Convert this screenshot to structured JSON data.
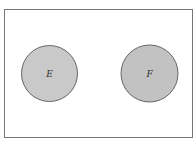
{
  "diagram": {
    "type": "venn",
    "universe": {
      "x": 4,
      "y": 9,
      "width": 189,
      "height": 129,
      "stroke": "#777777",
      "fill": "#ffffff"
    },
    "sets": [
      {
        "label": "E",
        "cx": 49.5,
        "cy": 73.5,
        "r": 28,
        "fill": "#c9c9c9",
        "stroke": "#666666"
      },
      {
        "label": "F",
        "cx": 149.5,
        "cy": 73.5,
        "r": 28.5,
        "fill": "#c2c2c2",
        "stroke": "#666666"
      }
    ],
    "relationship": "disjoint"
  }
}
